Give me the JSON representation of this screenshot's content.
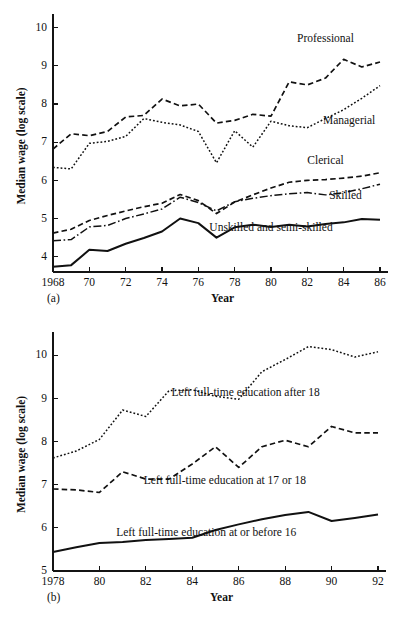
{
  "figure": {
    "panel_a_letter": "(a)",
    "panel_b_letter": "(b)"
  },
  "chart_data": [
    {
      "type": "line",
      "panel": "(a)",
      "title": "",
      "xlabel": "Year",
      "ylabel": "Median wage (log scale)",
      "xlim": [
        1968,
        1986
      ],
      "ylim": [
        3.6,
        10.2
      ],
      "grid": false,
      "legend_position": "inline-annotations",
      "xtick_labels": [
        "1968",
        "70",
        "72",
        "74",
        "76",
        "78",
        "80",
        "82",
        "84",
        "86"
      ],
      "xtick_values": [
        1968,
        1970,
        1972,
        1974,
        1976,
        1978,
        1980,
        1982,
        1984,
        1986
      ],
      "ytick_labels": [
        "4",
        "5",
        "6",
        "7",
        "8",
        "9",
        "10"
      ],
      "ytick_values": [
        4,
        5,
        6,
        7,
        8,
        9,
        10
      ],
      "x": [
        1968,
        1969,
        1970,
        1971,
        1972,
        1973,
        1974,
        1975,
        1976,
        1977,
        1978,
        1979,
        1980,
        1981,
        1982,
        1983,
        1984,
        1985,
        1986
      ],
      "series": [
        {
          "name": "Professional",
          "style": "dashed",
          "label": "Professional",
          "label_x": 1983.0,
          "label_y": 9.62,
          "values": [
            6.82,
            7.22,
            7.17,
            7.28,
            7.66,
            7.7,
            8.13,
            7.95,
            8.0,
            7.5,
            7.57,
            7.73,
            7.68,
            8.58,
            8.5,
            8.68,
            9.17,
            8.97,
            9.1
          ]
        },
        {
          "name": "Managerial",
          "style": "dotted",
          "label": "Managerial",
          "label_x": 1984.3,
          "label_y": 7.48,
          "values": [
            6.34,
            6.3,
            6.97,
            7.02,
            7.15,
            7.62,
            7.52,
            7.45,
            7.28,
            6.46,
            7.3,
            6.87,
            7.55,
            7.43,
            7.38,
            7.62,
            7.85,
            8.15,
            8.48
          ]
        },
        {
          "name": "Clerical",
          "style": "dashed",
          "label": "Clerical",
          "label_x": 1983.0,
          "label_y": 6.42,
          "values": [
            4.62,
            4.72,
            4.95,
            5.08,
            5.2,
            5.31,
            5.4,
            5.63,
            5.47,
            5.13,
            5.43,
            5.62,
            5.8,
            5.95,
            6.0,
            6.02,
            6.06,
            6.11,
            6.2
          ]
        },
        {
          "name": "Skilled",
          "style": "dashdot",
          "label": "Skilled",
          "label_x": 1984.1,
          "label_y": 5.52,
          "values": [
            4.42,
            4.45,
            4.78,
            4.82,
            5.0,
            5.12,
            5.25,
            5.56,
            5.42,
            5.2,
            5.44,
            5.53,
            5.6,
            5.65,
            5.68,
            5.62,
            5.68,
            5.78,
            5.9
          ]
        },
        {
          "name": "Unskilled and semi-skilled",
          "style": "solid",
          "label": "Unskilled and semi-skilled",
          "label_x": 1980.0,
          "label_y": 4.68,
          "values": [
            3.74,
            3.78,
            4.18,
            4.15,
            4.34,
            4.49,
            4.66,
            5.0,
            4.88,
            4.5,
            4.77,
            4.84,
            4.78,
            4.84,
            4.79,
            4.86,
            4.9,
            4.99,
            4.97
          ]
        }
      ]
    },
    {
      "type": "line",
      "panel": "(b)",
      "title": "",
      "xlabel": "Year",
      "ylabel": "Median wage (log scale)",
      "xlim": [
        1978,
        1992
      ],
      "ylim": [
        5,
        10.4
      ],
      "grid": false,
      "legend_position": "inline-annotations",
      "xtick_labels": [
        "1978",
        "80",
        "82",
        "84",
        "86",
        "88",
        "90",
        "92"
      ],
      "xtick_values": [
        1978,
        1980,
        1982,
        1984,
        1986,
        1988,
        1990,
        1992
      ],
      "ytick_labels": [
        "5",
        "6",
        "7",
        "8",
        "9",
        "10"
      ],
      "ytick_values": [
        5,
        6,
        7,
        8,
        9,
        10
      ],
      "x": [
        1978,
        1979,
        1980,
        1981,
        1982,
        1983,
        1984,
        1985,
        1986,
        1987,
        1988,
        1989,
        1990,
        1991,
        1992
      ],
      "series": [
        {
          "name": "Left full-time education after 18",
          "style": "dotted",
          "label": "Left full-time education after 18",
          "label_x": 1986.3,
          "label_y": 9.05,
          "values": [
            7.62,
            7.78,
            8.05,
            8.73,
            8.58,
            9.18,
            9.2,
            9.05,
            8.98,
            9.62,
            9.9,
            10.2,
            10.13,
            9.96,
            10.08
          ]
        },
        {
          "name": "Left full-time education at 17 or 18",
          "style": "dashed",
          "label": "Left full-time education at 17 or 18",
          "label_x": 1985.4,
          "label_y": 7.02,
          "values": [
            6.9,
            6.88,
            6.82,
            7.3,
            7.13,
            7.13,
            7.48,
            7.88,
            7.4,
            7.88,
            8.03,
            7.88,
            8.35,
            8.2,
            8.2
          ]
        },
        {
          "name": "Left full-time education at or before 16",
          "style": "solid",
          "label": "Left full-time education at or before 16",
          "label_x": 1984.6,
          "label_y": 5.82,
          "values": [
            5.44,
            5.55,
            5.65,
            5.67,
            5.72,
            5.74,
            5.77,
            5.95,
            6.08,
            6.2,
            6.3,
            6.37,
            6.16,
            6.23,
            6.31
          ]
        }
      ]
    }
  ]
}
